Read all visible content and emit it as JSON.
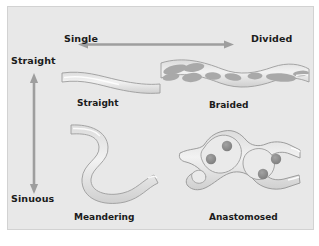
{
  "figure": {
    "background_color": "#e8e8e8",
    "panel_border_color": "#d2d2d2",
    "channel_fill_color": "#d9d9d9",
    "channel_outline_color": "#9a9a9a",
    "bar_fill_color": "#a8a8a8",
    "island_fill_color": "#8f8f8f",
    "arrow_color": "#9a9a9a",
    "text_color": "#1b1b1b"
  },
  "axes": {
    "horizontal": {
      "left_label": "Single",
      "right_label": "Divided",
      "arrow": "double-headed-horizontal"
    },
    "vertical": {
      "top_label": "Straight",
      "bottom_label": "Sinuous",
      "arrow": "double-headed-vertical"
    }
  },
  "quadrants": [
    {
      "id": "straight",
      "caption": "Straight",
      "position": "top-left",
      "description": "single straight channel"
    },
    {
      "id": "braided",
      "caption": "Braided",
      "position": "top-right",
      "description": "divided straight channel with mid-channel bars"
    },
    {
      "id": "meandering",
      "caption": "Meandering",
      "position": "bottom-left",
      "description": "single sinuous channel"
    },
    {
      "id": "anastomosed",
      "caption": "Anastomosed",
      "position": "bottom-right",
      "description": "divided sinuous channel with vegetated islands"
    }
  ]
}
